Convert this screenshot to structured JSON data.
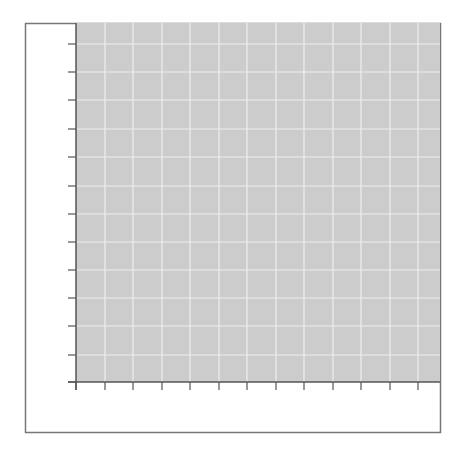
{
  "chart_data": {
    "type": "line",
    "title": "",
    "xlabel": "",
    "ylabel": "",
    "x_tick_count": 13,
    "y_tick_count": 13,
    "x_tick_labels": [],
    "y_tick_labels": [],
    "series": [],
    "grid": true,
    "legend": null,
    "colors": {
      "plot_background": "#cccccc",
      "gridline": "#eeeeee",
      "axis": "#555555",
      "frame": "#777777",
      "figure_background": "#ffffff"
    }
  },
  "layout": {
    "frame": {
      "x": 25,
      "y": 23,
      "width": 415,
      "height": 409
    },
    "plot": {
      "x": 76,
      "y": 23,
      "width": 364,
      "height": 359
    },
    "x_ticks_px": [
      76,
      105,
      133,
      162,
      190,
      219,
      247,
      276,
      304,
      333,
      361,
      390,
      418
    ],
    "y_ticks_px": [
      44,
      72,
      100,
      129,
      157,
      186,
      214,
      242,
      270,
      298,
      326,
      355,
      382
    ],
    "tick_length": 8
  }
}
